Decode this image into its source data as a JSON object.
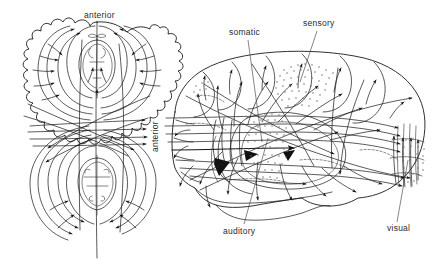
{
  "figure": {
    "background_color": "#ffffff",
    "line_color": "#1a1a1a",
    "stipple_color": "#6b6b6b",
    "width": 439,
    "height": 269
  },
  "labels": {
    "anterior_top": "anterior",
    "anterior_vertical": "anterior",
    "somatic": "somatic",
    "sensory": "sensory",
    "auditory": "auditory",
    "visual": "visual"
  },
  "panels": {
    "left": {
      "name": "dorsal-brain-view",
      "orientation_label": "anterior"
    },
    "right": {
      "name": "lateral-brain-view",
      "orientation_label": "anterior",
      "regions": [
        "somatic",
        "sensory",
        "auditory",
        "visual"
      ]
    }
  }
}
